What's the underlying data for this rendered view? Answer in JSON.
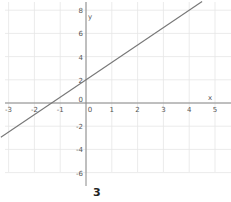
{
  "chart_data": {
    "type": "line",
    "title": "",
    "caption": "3",
    "xlabel": "x",
    "ylabel": "y",
    "xlim": [
      -3.3,
      5.6
    ],
    "ylim": [
      -7.2,
      8.8
    ],
    "grid": true,
    "x_ticks": [
      -3,
      -2,
      -1,
      0,
      1,
      2,
      3,
      4,
      5
    ],
    "y_ticks": [
      8,
      6,
      4,
      2,
      0,
      -2,
      -4,
      -6
    ],
    "series": [
      {
        "name": "y = 1.5x + 2",
        "slope": 1.5,
        "intercept": 2,
        "x": [
          -3.3,
          4.5
        ],
        "y": [
          -2.95,
          8.75
        ],
        "color": "#777777"
      }
    ],
    "annotations": [
      {
        "text": "x",
        "near": "positive x-axis end"
      },
      {
        "text": "y",
        "near": "positive y-axis top"
      }
    ]
  },
  "colors": {
    "axis": "#888888",
    "grid": "#e6e6e6",
    "line": "#777777",
    "text": "#555555"
  }
}
